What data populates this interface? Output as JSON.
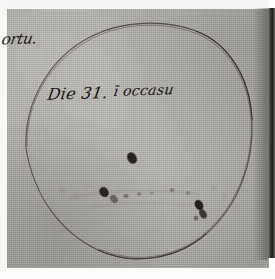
{
  "document": {
    "kind": "historical-manuscript-scan",
    "subject": "sunspot-observation-drawing",
    "margin_note": "ortu.",
    "inscription": {
      "full_text": "Die 31. ī occasu",
      "day_phrase": "Die 31.",
      "time_phrase": "ī occasu"
    }
  },
  "drawing": {
    "disc_label": "solar disc outline",
    "ink_color": "#3a372f",
    "paper_color": "#aeaca7",
    "spot_color": "#1a1814",
    "sunspots": [
      {
        "id": "spot-upper-center",
        "cx": 132,
        "cy": 158,
        "rx": 4.6,
        "ry": 6.0,
        "rot": -28,
        "opacity": 0.92
      },
      {
        "id": "spot-left-dark",
        "cx": 104,
        "cy": 192,
        "rx": 4.4,
        "ry": 5.2,
        "rot": -35,
        "opacity": 0.9
      },
      {
        "id": "spot-left-tail",
        "cx": 114,
        "cy": 199,
        "rx": 3.4,
        "ry": 4.4,
        "rot": -40,
        "opacity": 0.45
      },
      {
        "id": "spot-mid-faint-a",
        "cx": 126,
        "cy": 196,
        "rx": 2.6,
        "ry": 2.0,
        "rot": 10,
        "opacity": 0.34
      },
      {
        "id": "spot-mid-faint-b",
        "cx": 139,
        "cy": 194,
        "rx": 2.2,
        "ry": 1.7,
        "rot": 0,
        "opacity": 0.28
      },
      {
        "id": "spot-center-faint",
        "cx": 152,
        "cy": 193,
        "rx": 2.0,
        "ry": 1.5,
        "rot": 0,
        "opacity": 0.2
      },
      {
        "id": "spot-right-faint",
        "cx": 172,
        "cy": 190,
        "rx": 2.6,
        "ry": 2.0,
        "rot": 15,
        "opacity": 0.26
      },
      {
        "id": "spot-right-upper",
        "cx": 188,
        "cy": 193,
        "rx": 2.4,
        "ry": 1.9,
        "rot": 0,
        "opacity": 0.22
      },
      {
        "id": "spot-lower-right-a",
        "cx": 199,
        "cy": 205,
        "rx": 4.0,
        "ry": 5.4,
        "rot": -30,
        "opacity": 0.93
      },
      {
        "id": "spot-lower-right-b",
        "cx": 203,
        "cy": 214,
        "rx": 3.4,
        "ry": 5.0,
        "rot": -32,
        "opacity": 0.78
      },
      {
        "id": "spot-lower-right-c",
        "cx": 196,
        "cy": 218,
        "rx": 2.4,
        "ry": 2.6,
        "rot": 0,
        "opacity": 0.4
      }
    ],
    "faint_marks": [
      {
        "id": "mark-left-a",
        "cx": 62,
        "cy": 190,
        "rx": 3.2,
        "ry": 1.4,
        "rot": 20,
        "opacity": 0.16
      },
      {
        "id": "mark-left-b",
        "cx": 76,
        "cy": 196,
        "rx": 2.4,
        "ry": 1.3,
        "rot": -8,
        "opacity": 0.14
      },
      {
        "id": "mark-left-c",
        "cx": 88,
        "cy": 186,
        "rx": 2.0,
        "ry": 1.2,
        "rot": 0,
        "opacity": 0.13
      },
      {
        "id": "mark-right-a",
        "cx": 214,
        "cy": 188,
        "rx": 2.6,
        "ry": 1.4,
        "rot": 12,
        "opacity": 0.15
      },
      {
        "id": "mark-right-b",
        "cx": 224,
        "cy": 196,
        "rx": 2.2,
        "ry": 1.2,
        "rot": 0,
        "opacity": 0.12
      }
    ]
  }
}
